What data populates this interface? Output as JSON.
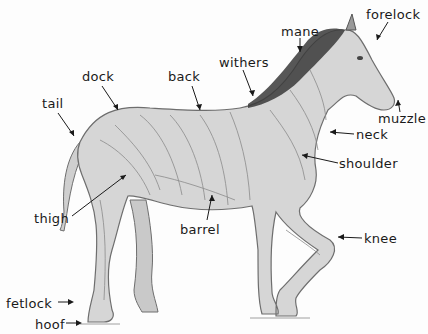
{
  "diagram": {
    "labels": [
      {
        "id": "forelock",
        "text": "forelock",
        "x": 366,
        "y": 8
      },
      {
        "id": "mane",
        "text": "mane",
        "x": 281,
        "y": 25
      },
      {
        "id": "withers",
        "text": "withers",
        "x": 219,
        "y": 56
      },
      {
        "id": "dock",
        "text": "dock",
        "x": 82,
        "y": 70
      },
      {
        "id": "back",
        "text": "back",
        "x": 168,
        "y": 70
      },
      {
        "id": "tail",
        "text": "tail",
        "x": 42,
        "y": 97
      },
      {
        "id": "muzzle",
        "text": "muzzle",
        "x": 378,
        "y": 112
      },
      {
        "id": "neck",
        "text": "neck",
        "x": 356,
        "y": 128
      },
      {
        "id": "shoulder",
        "text": "shoulder",
        "x": 339,
        "y": 157
      },
      {
        "id": "thigh",
        "text": "thigh",
        "x": 34,
        "y": 212
      },
      {
        "id": "barrel",
        "text": "barrel",
        "x": 180,
        "y": 223
      },
      {
        "id": "knee",
        "text": "knee",
        "x": 364,
        "y": 232
      },
      {
        "id": "fetlock",
        "text": "fetlock",
        "x": 6,
        "y": 297
      },
      {
        "id": "hoof",
        "text": "hoof",
        "x": 35,
        "y": 318
      }
    ],
    "colors": {
      "ink": "#1a1a1a",
      "body_fill": "#d6d6d6",
      "body_stroke": "#6e6e6e",
      "mane": "#3a3a3a",
      "muscle_line": "#8a8a8a"
    }
  }
}
